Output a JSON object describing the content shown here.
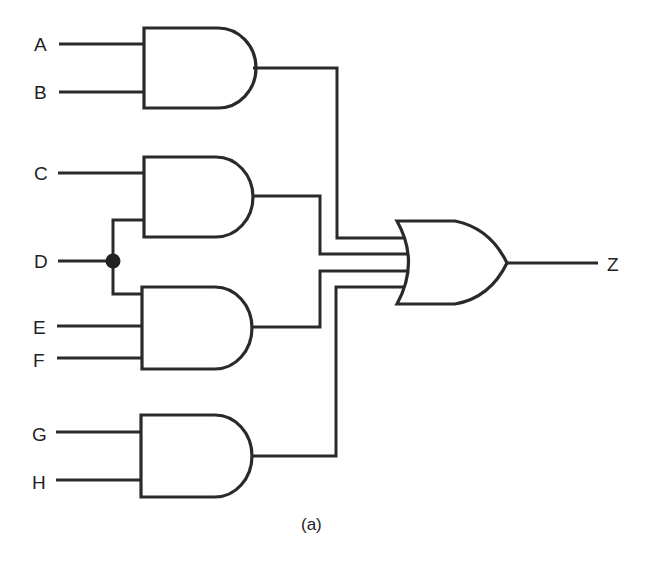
{
  "diagram": {
    "type": "logic-circuit",
    "caption": "(a)",
    "inputs": [
      "A",
      "B",
      "C",
      "D",
      "E",
      "F",
      "G",
      "H"
    ],
    "output": "Z",
    "gates": [
      {
        "id": "and1",
        "type": "AND",
        "inputs": [
          "A",
          "B"
        ]
      },
      {
        "id": "and2",
        "type": "AND",
        "inputs": [
          "C",
          "D"
        ]
      },
      {
        "id": "and3",
        "type": "AND",
        "inputs": [
          "D",
          "E",
          "F"
        ]
      },
      {
        "id": "and4",
        "type": "AND",
        "inputs": [
          "G",
          "H"
        ]
      },
      {
        "id": "or1",
        "type": "OR",
        "inputs": [
          "and1",
          "and2",
          "and3",
          "and4"
        ],
        "output": "Z"
      }
    ],
    "junctions": [
      {
        "signal": "D",
        "connects": [
          "and2",
          "and3"
        ]
      }
    ]
  },
  "labels": {
    "A": "A",
    "B": "B",
    "C": "C",
    "D": "D",
    "E": "E",
    "F": "F",
    "G": "G",
    "H": "H",
    "Z": "Z"
  },
  "colors": {
    "line": "#2a2a2a",
    "background": "#ffffff"
  }
}
